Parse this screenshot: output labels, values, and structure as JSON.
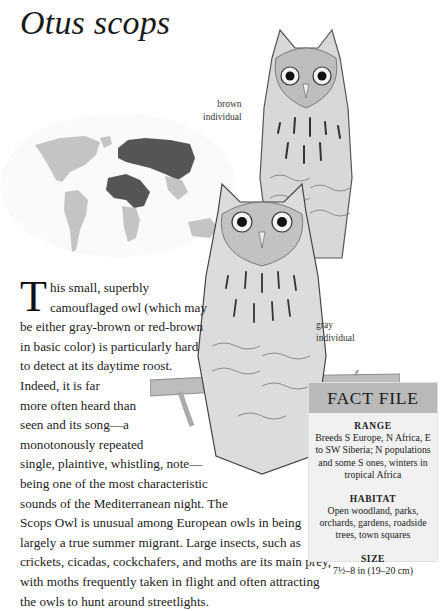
{
  "page": {
    "title": "Otus scops"
  },
  "illustrations": {
    "map": {
      "name": "distribution-map",
      "range_color": "#555555",
      "land_color": "#c4c4c4"
    },
    "owl_top": {
      "caption_line1": "brown",
      "caption_line2": "individual"
    },
    "owl_bottom": {
      "caption_line1": "gray",
      "caption_line2": "individual"
    }
  },
  "body": {
    "dropcap": "T",
    "lines": [
      "his small, superbly",
      "camouflaged owl (which may",
      "be either gray-brown or red-brown",
      "in basic color) is particularly hard",
      "to detect at its daytime roost.",
      "Indeed, it is far",
      "more often heard than",
      "seen and its song—a",
      "monotonously repeated",
      "single, plaintive, whistling, note—",
      "being one of the most characteristic",
      "sounds of the Mediterranean night. The",
      "Scops Owl is unusual among European owls in being",
      "largely a true summer migrant. Large insects, such as",
      "crickets, cicadas, cockchafers, and moths are its main prey,",
      "with moths frequently taken in flight and often attracting",
      "the owls to hunt around streetlights."
    ]
  },
  "fact_file": {
    "heading": "FACT FILE",
    "header_color": "#b9b9b9",
    "body_color": "#f1f1f1",
    "sections": [
      {
        "label": "RANGE",
        "text": "Breeds S Europe, N Africa, E to SW Siberia; N populations and some S ones, winters in tropical Africa"
      },
      {
        "label": "HABITAT",
        "text": "Open woodland, parks, orchards, gardens, roadside trees, town squares"
      },
      {
        "label": "SIZE",
        "text": "7½–8 in (19–20 cm)"
      }
    ]
  }
}
